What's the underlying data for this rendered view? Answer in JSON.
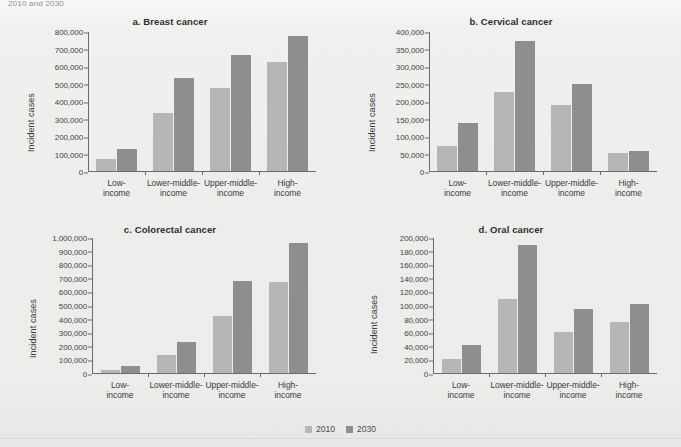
{
  "page": {
    "top_caption_fragment": "2010 and 2030",
    "background_color": "#efefed"
  },
  "legend": {
    "position": "bottom-center",
    "items": [
      {
        "label": "2010",
        "color": "#b6b6b4",
        "swatch_icon": "square-swatch-icon"
      },
      {
        "label": "2030",
        "color": "#8e8e8c",
        "swatch_icon": "square-swatch-icon"
      }
    ]
  },
  "categories": [
    "Low-income",
    "Lower-middle-income",
    "Upper-middle-income",
    "High-income"
  ],
  "category_lines": [
    [
      "Low-",
      "income"
    ],
    [
      "Lower-middle-",
      "income"
    ],
    [
      "Upper-middle-",
      "income"
    ],
    [
      "High-",
      "income"
    ]
  ],
  "chart_data": [
    {
      "type": "bar",
      "panel": "a",
      "title": "a. Breast cancer",
      "xlabel": "",
      "ylabel": "Incident cases",
      "categories": [
        "Low-income",
        "Lower-middle-income",
        "Upper-middle-income",
        "High-income"
      ],
      "series": [
        {
          "name": "2010",
          "color": "#b6b6b4",
          "values": [
            70000,
            335000,
            480000,
            630000
          ]
        },
        {
          "name": "2030",
          "color": "#8e8e8c",
          "values": [
            125000,
            535000,
            665000,
            775000
          ]
        }
      ],
      "ylim": [
        0,
        800000
      ],
      "ytick_step": 100000,
      "yticks": [
        0,
        100000,
        200000,
        300000,
        400000,
        500000,
        600000,
        700000,
        800000
      ],
      "ytick_labels": [
        "0",
        "100,000",
        "200,000",
        "300,000",
        "400,000",
        "500,000",
        "600,000",
        "700,000",
        "800,000"
      ],
      "grid": false,
      "legend_position": "figure-bottom"
    },
    {
      "type": "bar",
      "panel": "b",
      "title": "b. Cervical cancer",
      "xlabel": "",
      "ylabel": "Incident cases",
      "categories": [
        "Low-income",
        "Lower-middle-income",
        "Upper-middle-income",
        "High-income"
      ],
      "series": [
        {
          "name": "2010",
          "color": "#b6b6b4",
          "values": [
            72000,
            228000,
            190000,
            52000
          ]
        },
        {
          "name": "2030",
          "color": "#8e8e8c",
          "values": [
            137000,
            375000,
            250000,
            58000
          ]
        }
      ],
      "ylim": [
        0,
        400000
      ],
      "ytick_step": 50000,
      "yticks": [
        0,
        50000,
        100000,
        150000,
        200000,
        250000,
        300000,
        350000,
        400000
      ],
      "ytick_labels": [
        "0",
        "50,000",
        "100,000",
        "150,000",
        "200,000",
        "250,000",
        "300,000",
        "350,000",
        "400,000"
      ],
      "grid": false,
      "legend_position": "figure-bottom"
    },
    {
      "type": "bar",
      "panel": "c",
      "title": "c. Colorectal cancer",
      "xlabel": "",
      "ylabel": "Incident cases",
      "categories": [
        "Low-income",
        "Lower-middle-income",
        "Upper-middle-income",
        "High-income"
      ],
      "series": [
        {
          "name": "2010",
          "color": "#b6b6b4",
          "values": [
            25000,
            135000,
            420000,
            675000
          ]
        },
        {
          "name": "2030",
          "color": "#8e8e8c",
          "values": [
            55000,
            230000,
            680000,
            960000
          ]
        }
      ],
      "ylim": [
        0,
        1000000
      ],
      "ytick_step": 100000,
      "yticks": [
        0,
        100000,
        200000,
        300000,
        400000,
        500000,
        600000,
        700000,
        800000,
        900000,
        1000000
      ],
      "ytick_labels": [
        "0",
        "100,000",
        "200,000",
        "300,000",
        "400,000",
        "500,000",
        "600,000",
        "700,000",
        "800,000",
        "900,000",
        "1,000,000"
      ],
      "grid": false,
      "legend_position": "figure-bottom"
    },
    {
      "type": "bar",
      "panel": "d",
      "title": "d. Oral cancer",
      "xlabel": "",
      "ylabel": "Incident cases",
      "categories": [
        "Low-income",
        "Lower-middle-income",
        "Upper-middle-income",
        "High-income"
      ],
      "series": [
        {
          "name": "2010",
          "color": "#b6b6b4",
          "values": [
            21000,
            110000,
            61000,
            76000
          ]
        },
        {
          "name": "2030",
          "color": "#8e8e8c",
          "values": [
            41000,
            189000,
            95000,
            102000
          ]
        }
      ],
      "ylim": [
        0,
        200000
      ],
      "ytick_step": 20000,
      "yticks": [
        0,
        20000,
        40000,
        60000,
        80000,
        100000,
        120000,
        140000,
        160000,
        180000,
        200000
      ],
      "ytick_labels": [
        "0",
        "20,000",
        "40,000",
        "60,000",
        "80,000",
        "100,000",
        "120,000",
        "140,000",
        "160,000",
        "180,000",
        "200,000"
      ],
      "grid": false,
      "legend_position": "figure-bottom"
    }
  ]
}
